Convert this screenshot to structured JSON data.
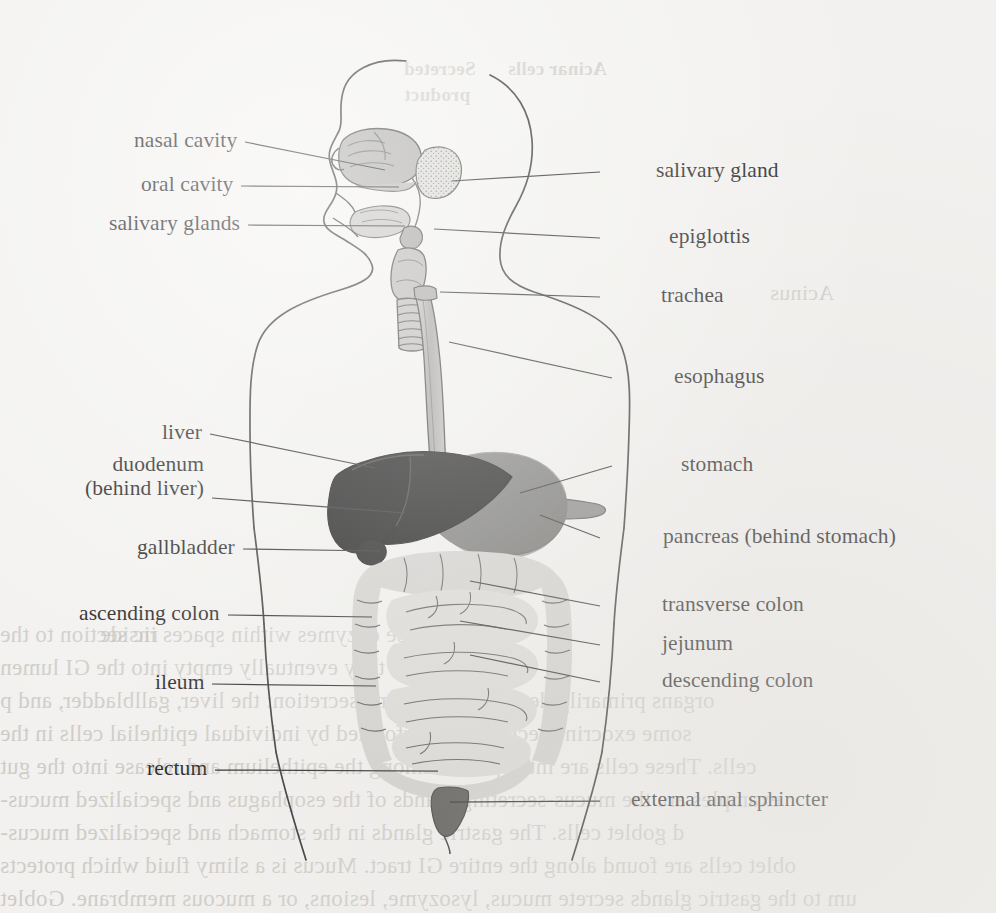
{
  "figure": {
    "background_color": "#f2f1ef",
    "ink_color": "#1d1c1b",
    "organ_fills": {
      "liver": "#050505",
      "stomach": "#6e6e6e",
      "pancreas": "#7d7d7d",
      "intestine": "#d7d6d2",
      "colon": "#cfceca",
      "airway": "#a9a8a5",
      "rectum": "#4a4a48",
      "salivary_gland": "#c9c8c4",
      "nasal_cavity": "#a6a5a2"
    }
  },
  "labels_left": [
    {
      "id": "nasal-cavity",
      "text": "nasal cavity",
      "text2": "",
      "x": 108,
      "y": 128,
      "lx1": 245,
      "ly1": 142,
      "lx2": 385,
      "ly2": 170
    },
    {
      "id": "oral-cavity",
      "text": "oral cavity",
      "text2": "",
      "x": 124,
      "y": 172,
      "lx1": 241,
      "ly1": 186,
      "lx2": 399,
      "ly2": 187
    },
    {
      "id": "salivary-glands",
      "text": "salivary glands",
      "text2": "",
      "x": 75,
      "y": 211,
      "lx1": 248,
      "ly1": 225,
      "lx2": 405,
      "ly2": 226
    },
    {
      "id": "liver",
      "text": "liver",
      "text2": "",
      "x": 152,
      "y": 420,
      "lx1": 210,
      "ly1": 434,
      "lx2": 375,
      "ly2": 468
    },
    {
      "id": "duodenum",
      "text": "duodenum",
      "text2": "(behind liver)",
      "x": 87,
      "y": 452,
      "lx1": 212,
      "ly1": 498,
      "lx2": 405,
      "ly2": 513
    },
    {
      "id": "gallbladder",
      "text": "gallbladder",
      "text2": "",
      "x": 105,
      "y": 535,
      "lx1": 243,
      "ly1": 549,
      "lx2": 380,
      "ly2": 551
    },
    {
      "id": "ascending-colon",
      "text": "ascending colon",
      "text2": "",
      "x": 60,
      "y": 601,
      "lx1": 228,
      "ly1": 615,
      "lx2": 372,
      "ly2": 617
    },
    {
      "id": "ileum",
      "text": "ileum",
      "text2": "",
      "x": 155,
      "y": 670,
      "lx1": 212,
      "ly1": 684,
      "lx2": 376,
      "ly2": 686
    },
    {
      "id": "rectum",
      "text": "rectum",
      "text2": "",
      "x": 141,
      "y": 756,
      "lx1": 215,
      "ly1": 770,
      "lx2": 438,
      "ly2": 771
    }
  ],
  "labels_right": [
    {
      "id": "salivary-gland",
      "text": "salivary gland",
      "x": 656,
      "y": 158,
      "lx1": 600,
      "ly1": 172,
      "lx2": 452,
      "ly2": 181
    },
    {
      "id": "epiglottis",
      "text": "epiglottis",
      "x": 669,
      "y": 224,
      "lx1": 600,
      "ly1": 238,
      "lx2": 434,
      "ly2": 229
    },
    {
      "id": "trachea",
      "text": "trachea",
      "x": 661,
      "y": 283,
      "lx1": 600,
      "ly1": 297,
      "lx2": 440,
      "ly2": 292
    },
    {
      "id": "esophagus",
      "text": "esophagus",
      "x": 674,
      "y": 364,
      "lx1": 612,
      "ly1": 378,
      "lx2": 449,
      "ly2": 342
    },
    {
      "id": "stomach",
      "text": "stomach",
      "x": 681,
      "y": 452,
      "lx1": 612,
      "ly1": 466,
      "lx2": 520,
      "ly2": 493
    },
    {
      "id": "pancreas",
      "text": "pancreas (behind stomach)",
      "x": 663,
      "y": 524,
      "lx1": 600,
      "ly1": 538,
      "lx2": 540,
      "ly2": 515
    },
    {
      "id": "transverse-colon",
      "text": "transverse colon",
      "x": 662,
      "y": 592,
      "lx1": 600,
      "ly1": 606,
      "lx2": 470,
      "ly2": 581
    },
    {
      "id": "jejunum",
      "text": "jejunum",
      "x": 662,
      "y": 631,
      "lx1": 600,
      "ly1": 645,
      "lx2": 460,
      "ly2": 621
    },
    {
      "id": "descending-colon",
      "text": "descending colon",
      "x": 662,
      "y": 668,
      "lx1": 600,
      "ly1": 682,
      "lx2": 470,
      "ly2": 655
    },
    {
      "id": "external-anal-sphincter",
      "text": "external anal sphincter",
      "x": 631,
      "y": 787,
      "lx1": 600,
      "ly1": 801,
      "lx2": 450,
      "ly2": 802
    }
  ],
  "bleed_through": [
    {
      "text": "Secreted",
      "x": 404,
      "y": 58,
      "size": 19,
      "weight": 600
    },
    {
      "text": "Acinar cells",
      "x": 508,
      "y": 58,
      "size": 19,
      "weight": 600
    },
    {
      "text": "product",
      "x": 404,
      "y": 84,
      "size": 19,
      "weight": 600
    },
    {
      "text": "Acinus",
      "x": 770,
      "y": 280,
      "size": 22,
      "weight": 400
    },
    {
      "text": "ric section to the",
      "x": 0,
      "y": 622,
      "size": 23,
      "weight": 400
    },
    {
      "text": "nds release enzymes within spaces inside",
      "x": 100,
      "y": 622,
      "size": 23,
      "weight": 400
    },
    {
      "text": "ndividual cells, they eventually empty into the GI lumen",
      "x": 0,
      "y": 655,
      "size": 23,
      "weight": 400
    },
    {
      "text": "organs primarily devoted to exocrine secretion: the liver, gallbladder, and p",
      "x": 0,
      "y": 688,
      "size": 23,
      "weight": 400
    },
    {
      "text": "some exocrine secretion is performed by individual epithelial cells in the",
      "x": 0,
      "y": 721,
      "size": 23,
      "weight": 400
    },
    {
      "text": "cells. These cells are interspersed among the epithelium and release into the gut",
      "x": 0,
      "y": 754,
      "size": 23,
      "weight": 400
    },
    {
      "text": "examples are the mucus-secreting glands of the esophagus and specialized mucus-",
      "x": 0,
      "y": 787,
      "size": 23,
      "weight": 400
    },
    {
      "text": "d goblet cells. The gastric glands in the stomach and specialized mucus-",
      "x": 0,
      "y": 820,
      "size": 23,
      "weight": 400
    },
    {
      "text": "oblet cells are found along the entire GI tract. Mucus is a slimy fluid which protects",
      "x": 0,
      "y": 853,
      "size": 23,
      "weight": 400
    },
    {
      "text": "um to the gastric glands secrete mucus, lysozyme, lesions, or a mucous membrane. Goblet",
      "x": 0,
      "y": 886,
      "size": 23,
      "weight": 400
    }
  ]
}
